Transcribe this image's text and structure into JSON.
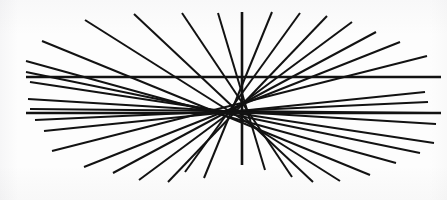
{
  "figure": {
    "background_color": "#fdfdfd",
    "line_color": "#121212",
    "canvas": {
      "width": 447,
      "height": 200
    },
    "center": {
      "x": 242,
      "y": 91
    },
    "stroke_widths": {
      "ray": 2.0,
      "parallel": 2.6,
      "vertical": 2.6
    }
  },
  "chart_data": {
    "type": "scatter",
    "xlabel": "",
    "ylabel": "",
    "xlim": [
      0,
      447
    ],
    "ylim": [
      0,
      200
    ],
    "grid": false,
    "legend": "none",
    "center": [
      242,
      91
    ],
    "series": [
      {
        "name": "radiating-rays",
        "stroke": "#121212",
        "width": 2.0,
        "segments": [
          [
            242,
            12,
            242,
            165
          ],
          [
            218,
            13,
            265,
            170
          ],
          [
            182,
            13,
            292,
            177
          ],
          [
            134,
            14,
            313,
            182
          ],
          [
            85,
            20,
            340,
            181
          ],
          [
            42,
            41,
            370,
            175
          ],
          [
            26,
            61,
            396,
            163
          ],
          [
            26,
            72,
            420,
            153
          ],
          [
            30,
            82,
            434,
            143
          ],
          [
            28,
            99,
            436,
            124
          ],
          [
            30,
            109,
            432,
            113
          ],
          [
            35,
            120,
            428,
            102
          ],
          [
            44,
            131,
            425,
            92
          ],
          [
            52,
            151,
            427,
            56
          ],
          [
            84,
            167,
            400,
            42
          ],
          [
            113,
            173,
            376,
            32
          ],
          [
            139,
            180,
            352,
            22
          ],
          [
            168,
            182,
            327,
            16
          ],
          [
            185,
            172,
            300,
            13
          ],
          [
            204,
            178,
            272,
            12
          ]
        ]
      },
      {
        "name": "horizontal-parallels",
        "stroke": "#121212",
        "width": 2.6,
        "segments": [
          [
            26,
            77,
            441,
            77
          ],
          [
            26,
            113,
            441,
            113
          ]
        ]
      }
    ]
  },
  "rays": [
    {
      "id": "ray-vertical",
      "x1": 242,
      "y1": 12,
      "x2": 242,
      "y2": 165,
      "width": 2.6
    },
    {
      "id": "ray-01",
      "x1": 218,
      "y1": 13,
      "x2": 265,
      "y2": 170,
      "width": 2.0
    },
    {
      "id": "ray-02",
      "x1": 182,
      "y1": 13,
      "x2": 292,
      "y2": 177,
      "width": 2.0
    },
    {
      "id": "ray-03",
      "x1": 134,
      "y1": 14,
      "x2": 313,
      "y2": 182,
      "width": 2.0
    },
    {
      "id": "ray-04",
      "x1": 85,
      "y1": 20,
      "x2": 340,
      "y2": 181,
      "width": 2.0
    },
    {
      "id": "ray-05",
      "x1": 42,
      "y1": 41,
      "x2": 370,
      "y2": 175,
      "width": 2.0
    },
    {
      "id": "ray-06",
      "x1": 26,
      "y1": 61,
      "x2": 396,
      "y2": 163,
      "width": 2.0
    },
    {
      "id": "ray-07",
      "x1": 26,
      "y1": 72,
      "x2": 420,
      "y2": 153,
      "width": 2.0
    },
    {
      "id": "ray-08",
      "x1": 30,
      "y1": 82,
      "x2": 434,
      "y2": 143,
      "width": 2.0
    },
    {
      "id": "ray-09",
      "x1": 28,
      "y1": 99,
      "x2": 436,
      "y2": 124,
      "width": 2.0
    },
    {
      "id": "ray-10",
      "x1": 30,
      "y1": 109,
      "x2": 432,
      "y2": 113,
      "width": 2.0
    },
    {
      "id": "ray-11",
      "x1": 35,
      "y1": 120,
      "x2": 428,
      "y2": 102,
      "width": 2.0
    },
    {
      "id": "ray-12",
      "x1": 44,
      "y1": 131,
      "x2": 425,
      "y2": 92,
      "width": 2.0
    },
    {
      "id": "ray-13",
      "x1": 52,
      "y1": 151,
      "x2": 427,
      "y2": 56,
      "width": 2.0
    },
    {
      "id": "ray-14",
      "x1": 84,
      "y1": 167,
      "x2": 400,
      "y2": 42,
      "width": 2.0
    },
    {
      "id": "ray-15",
      "x1": 113,
      "y1": 173,
      "x2": 376,
      "y2": 32,
      "width": 2.0
    },
    {
      "id": "ray-16",
      "x1": 139,
      "y1": 180,
      "x2": 352,
      "y2": 22,
      "width": 2.0
    },
    {
      "id": "ray-17",
      "x1": 168,
      "y1": 182,
      "x2": 327,
      "y2": 16,
      "width": 2.0
    },
    {
      "id": "ray-18",
      "x1": 185,
      "y1": 172,
      "x2": 300,
      "y2": 13,
      "width": 2.0
    },
    {
      "id": "ray-19",
      "x1": 204,
      "y1": 178,
      "x2": 272,
      "y2": 12,
      "width": 2.0
    }
  ],
  "parallels": [
    {
      "id": "parallel-top",
      "x1": 26,
      "y1": 77,
      "x2": 441,
      "y2": 77,
      "width": 2.6
    },
    {
      "id": "parallel-bottom",
      "x1": 26,
      "y1": 113,
      "x2": 441,
      "y2": 113,
      "width": 2.6
    }
  ]
}
